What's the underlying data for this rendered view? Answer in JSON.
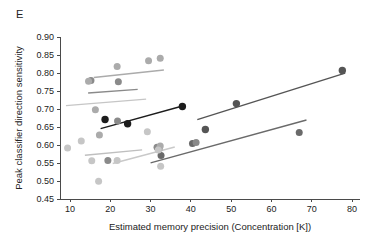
{
  "panel": {
    "label": "E"
  },
  "chart_data": {
    "type": "scatter",
    "title": "",
    "xlabel": "Estimated memory precision (Concentration [K])",
    "ylabel": "Peak classifier direction sensitivity",
    "xlim": [
      5,
      82
    ],
    "ylim": [
      0.45,
      0.9
    ],
    "xticks": [
      10,
      20,
      30,
      40,
      50,
      60,
      70,
      80
    ],
    "xtick_labels": [
      "10",
      "20",
      "30",
      "40",
      "50",
      "60",
      "70",
      "80"
    ],
    "yticks": [
      0.45,
      0.5,
      0.55,
      0.6,
      0.65,
      0.7,
      0.75,
      0.8,
      0.85,
      0.9
    ],
    "ytick_labels": [
      "0.45",
      "0.50",
      "0.55",
      "0.60",
      "0.65",
      "0.70",
      "0.75",
      "0.80",
      "0.85",
      "0.90"
    ],
    "grid": false,
    "legend": "none",
    "series": [
      {
        "name": "series-1-black",
        "color": "#1c1c1c",
        "marker_size": 5.0,
        "points": [
          {
            "x": 18.7,
            "y": 0.671
          },
          {
            "x": 24.3,
            "y": 0.659
          },
          {
            "x": 37.9,
            "y": 0.707
          }
        ],
        "fit_line": {
          "x0": 17.6,
          "y0": 0.6455,
          "x1": 38.6,
          "y1": 0.7105
        }
      },
      {
        "name": "series-2-dark-gray",
        "color": "#555555",
        "marker_size": 5.0,
        "points": [
          {
            "x": 43.6,
            "y": 0.643
          },
          {
            "x": 51.3,
            "y": 0.715
          },
          {
            "x": 77.6,
            "y": 0.807
          }
        ],
        "fit_line": {
          "x0": 41.6,
          "y0": 0.6705,
          "x1": 78.3,
          "y1": 0.7995
        }
      },
      {
        "name": "series-3-mid-gray",
        "color": "#6a6a6a",
        "marker_size": 4.6,
        "points": [
          {
            "x": 32.6,
            "y": 0.571
          },
          {
            "x": 40.4,
            "y": 0.604
          },
          {
            "x": 66.9,
            "y": 0.635
          }
        ],
        "fit_line": {
          "x0": 30.0,
          "y0": 0.5505,
          "x1": 68.7,
          "y1": 0.6695
        }
      },
      {
        "name": "series-4-gray",
        "color": "#8a8a8a",
        "marker_size": 4.6,
        "points": [
          {
            "x": 15.2,
            "y": 0.779
          },
          {
            "x": 22.0,
            "y": 0.776
          },
          {
            "x": 21.8,
            "y": 0.667
          },
          {
            "x": 19.4,
            "y": 0.557
          },
          {
            "x": 31.6,
            "y": 0.594
          },
          {
            "x": 41.3,
            "y": 0.607
          }
        ],
        "fit_line": {
          "x0": 14.5,
          "y0": 0.7445,
          "x1": 26.8,
          "y1": 0.7545
        }
      },
      {
        "name": "series-5-light-gray",
        "color": "#ababab",
        "marker_size": 4.6,
        "points": [
          {
            "x": 14.6,
            "y": 0.777
          },
          {
            "x": 21.7,
            "y": 0.818
          },
          {
            "x": 29.5,
            "y": 0.834
          },
          {
            "x": 32.4,
            "y": 0.841
          },
          {
            "x": 16.3,
            "y": 0.698
          },
          {
            "x": 17.3,
            "y": 0.628
          },
          {
            "x": 32.2,
            "y": 0.59
          },
          {
            "x": 32.4,
            "y": 0.597
          }
        ],
        "fit_line": {
          "x0": 15.9,
          "y0": 0.7875,
          "x1": 33.3,
          "y1": 0.8085
        }
      },
      {
        "name": "series-6-lightest-gray",
        "color": "#c6c6c6",
        "marker_size": 4.6,
        "points": [
          {
            "x": 9.4,
            "y": 0.592
          },
          {
            "x": 12.8,
            "y": 0.611
          },
          {
            "x": 15.4,
            "y": 0.556
          },
          {
            "x": 17.1,
            "y": 0.499
          },
          {
            "x": 21.7,
            "y": 0.557
          },
          {
            "x": 29.2,
            "y": 0.637
          },
          {
            "x": 32.5,
            "y": 0.541
          },
          {
            "x": 31.9,
            "y": 0.586
          }
        ],
        "fit_line": {
          "x0": 9.0,
          "y0": 0.7095,
          "x1": 28.9,
          "y1": 0.7275
        }
      },
      {
        "name": "series-7-pale-fit",
        "color": "#bfbfbf",
        "marker_size": 0,
        "points": [],
        "fit_line": {
          "x0": 13.7,
          "y0": 0.5715,
          "x1": 27.9,
          "y1": 0.5865
        }
      },
      {
        "name": "series-8-pale-fit-lower",
        "color": "#c9c9c9",
        "marker_size": 0,
        "points": [],
        "fit_line": {
          "x0": 20.6,
          "y0": 0.5485,
          "x1": 36.0,
          "y1": 0.5945
        }
      }
    ]
  }
}
